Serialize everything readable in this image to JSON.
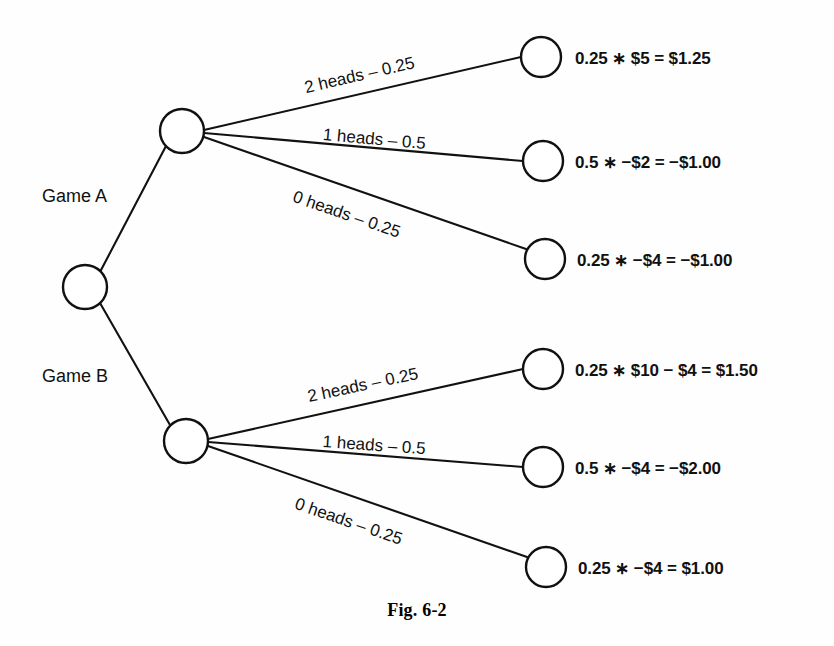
{
  "figure": {
    "caption": "Fig. 6-2"
  },
  "decisions": [
    {
      "id": "game-a",
      "label": "Game A"
    },
    {
      "id": "game-b",
      "label": "Game B"
    }
  ],
  "branches": [
    {
      "id": "a-2-heads",
      "label": "2 heads – 0.25",
      "outcome": "2 heads",
      "probability": 0.25,
      "game": "Game A"
    },
    {
      "id": "a-1-heads",
      "label": "1 heads – 0.5",
      "outcome": "1 heads",
      "probability": 0.5,
      "game": "Game A"
    },
    {
      "id": "a-0-heads",
      "label": "0 heads – 0.25",
      "outcome": "0 heads",
      "probability": 0.25,
      "game": "Game A"
    },
    {
      "id": "b-2-heads",
      "label": "2 heads – 0.25",
      "outcome": "2 heads",
      "probability": 0.25,
      "game": "Game B"
    },
    {
      "id": "b-1-heads",
      "label": "1 heads – 0.5",
      "outcome": "1 heads",
      "probability": 0.5,
      "game": "Game B"
    },
    {
      "id": "b-0-heads",
      "label": "0 heads – 0.25",
      "outcome": "0 heads",
      "probability": 0.25,
      "game": "Game B"
    }
  ],
  "payoffs": [
    {
      "id": "payoff-a-2",
      "text": "0.25 ∗ $5 = $1.25"
    },
    {
      "id": "payoff-a-1",
      "text": "0.5 ∗ −$2 = −$1.00"
    },
    {
      "id": "payoff-a-0",
      "text": "0.25 ∗ −$4 = −$1.00"
    },
    {
      "id": "payoff-b-2",
      "text": "0.25 ∗ $10 − $4 = $1.50"
    },
    {
      "id": "payoff-b-1",
      "text": "0.5 ∗ −$4 = −$2.00"
    },
    {
      "id": "payoff-b-0",
      "text": "0.25 ∗ −$4 = $1.00"
    }
  ],
  "colors": {
    "ink": "#111111",
    "background": "#fefefe",
    "node_fill": "#ffffff"
  }
}
